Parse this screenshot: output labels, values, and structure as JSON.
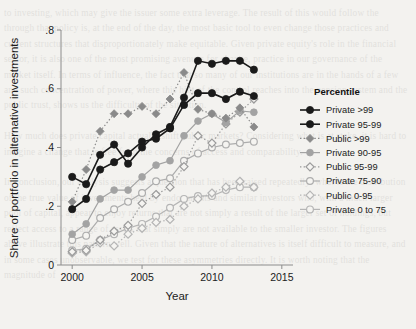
{
  "chart_data": {
    "type": "line",
    "title": "",
    "xlabel": "Year",
    "ylabel": "Share of portfolio in alternative investments",
    "xlim": [
      1999.2,
      2015.8
    ],
    "ylim": [
      0,
      0.8
    ],
    "xticks": [
      "2000",
      "2005",
      "2010",
      "2015"
    ],
    "xtick_values": [
      2000,
      2005,
      2010,
      2015
    ],
    "yticks": [
      "0",
      ".2",
      ".4",
      ".6",
      ".8"
    ],
    "ytick_values": [
      0,
      0.2,
      0.4,
      0.6,
      0.8
    ],
    "grid": false,
    "legend_position": "right",
    "legend_title": "Percentile",
    "x": [
      2000,
      2001,
      2002,
      2003,
      2004,
      2005,
      2006,
      2007,
      2008,
      2009,
      2010,
      2011,
      2012,
      2013
    ],
    "series": [
      {
        "name": "Private >99",
        "marker": "filled-circle",
        "linestyle": "solid",
        "color": "#1a1a1a",
        "values": [
          0.3,
          0.275,
          0.375,
          0.41,
          0.345,
          0.4,
          0.445,
          0.47,
          0.57,
          0.695,
          0.685,
          0.695,
          0.695,
          0.665
        ]
      },
      {
        "name": "Private 95-99",
        "marker": "filled-circle",
        "linestyle": "solid",
        "color": "#1a1a1a",
        "values": [
          0.19,
          0.225,
          0.325,
          0.35,
          0.38,
          0.42,
          0.43,
          0.465,
          0.545,
          0.585,
          0.585,
          0.565,
          0.59,
          0.575
        ]
      },
      {
        "name": "Public >99",
        "marker": "filled-diamond",
        "linestyle": "dotted",
        "color": "#8a8a8a",
        "values": [
          0.215,
          0.325,
          0.455,
          0.515,
          0.515,
          0.54,
          0.515,
          0.565,
          0.655,
          0.53,
          0.515,
          0.5,
          0.535,
          0.47
        ]
      },
      {
        "name": "Private 90-95",
        "marker": "filled-circle",
        "linestyle": "solid",
        "color": "#a3a3a3",
        "values": [
          0.105,
          0.14,
          0.225,
          0.255,
          0.255,
          0.3,
          0.34,
          0.355,
          0.44,
          0.49,
          0.515,
          0.485,
          0.525,
          0.52
        ]
      },
      {
        "name": "Public 95-99",
        "marker": "open-diamond",
        "linestyle": "dotted",
        "color": "#9b9b9b",
        "values": [
          0.045,
          0.05,
          0.085,
          0.115,
          0.135,
          0.21,
          0.24,
          0.265,
          0.335,
          0.44,
          0.415,
          0.48,
          0.52,
          0.565
        ]
      },
      {
        "name": "Private 75-90",
        "marker": "open-circle",
        "linestyle": "solid",
        "color": "#adadad",
        "values": [
          0.085,
          0.1,
          0.16,
          0.19,
          0.215,
          0.245,
          0.285,
          0.295,
          0.355,
          0.38,
          0.4,
          0.41,
          0.415,
          0.42
        ]
      },
      {
        "name": "Public 0-95",
        "marker": "open-diamond",
        "linestyle": "dotted",
        "color": "#b5b5b5",
        "values": [
          0.04,
          0.045,
          0.075,
          0.065,
          0.105,
          0.125,
          0.145,
          0.155,
          0.2,
          0.225,
          0.245,
          0.265,
          0.285,
          0.265
        ]
      },
      {
        "name": "Private 0 to 75",
        "marker": "open-circle",
        "linestyle": "solid",
        "color": "#b5b5b5",
        "values": [
          0.05,
          0.055,
          0.085,
          0.105,
          0.125,
          0.14,
          0.165,
          0.195,
          0.225,
          0.235,
          0.235,
          0.255,
          0.265,
          0.265
        ]
      }
    ]
  },
  "background_text": "to investing, which may give the issuer some extra leverage. The result of this would follow the through that policy is, at the end of the day, the most basic tool to even change those practices and current structures that disproportionately make equitable. Given private equity's role in the financial sector, it is also one of the most promising avenues for change, practice in our governance of the market itself. In terms of influence, the fact that so many of our institutions are in the hands of a few and such concentration of power, where this hint of the control reaches into the pension system and the public trust, shows us the difficulty of the situation.\n\nHow much does private capital actually shift public markets? Considering what is at stake, it is hard to imagine a change that is free from the concerns of access and comparability.\n\nIn conclusion, our analysis suggests a question that has been raised repeatedly: what is the distribution of the true value of investments held by endowments and similar investors who, with a much larger pool of capital, appear to enjoy returns that are not simply a result of the larger set of holdings, but reflect access to a range of assets that simply are not available to the smaller investor. The figures above illustrate this pattern well. Given that the nature of alternatives is itself difficult to measure, and in some cases unobservable, we test for these asymmetries directly. It is worth noting that the magnitude of"
}
